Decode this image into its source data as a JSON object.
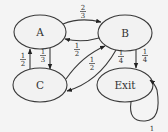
{
  "diagram": {
    "type": "markov-chain-state-diagram",
    "nodes": [
      {
        "id": "A",
        "label": "A"
      },
      {
        "id": "B",
        "label": "B"
      },
      {
        "id": "C",
        "label": "C"
      },
      {
        "id": "Exit",
        "label": "Exit"
      }
    ],
    "edges": [
      {
        "from": "A",
        "to": "B",
        "num": "2",
        "den": "3"
      },
      {
        "from": "B",
        "to": "A",
        "num": "1",
        "den": "2"
      },
      {
        "from": "A",
        "to": "C",
        "num": "1",
        "den": "3"
      },
      {
        "from": "C",
        "to": "A",
        "num": "1",
        "den": "2"
      },
      {
        "from": "C",
        "to": "B",
        "num": "1",
        "den": "2"
      },
      {
        "from": "B",
        "to": "C",
        "num": "1",
        "den": "4"
      },
      {
        "from": "B",
        "to": "Exit",
        "num": "1",
        "den": "4"
      },
      {
        "from": "Exit",
        "to": "Exit",
        "label": "1"
      }
    ]
  }
}
